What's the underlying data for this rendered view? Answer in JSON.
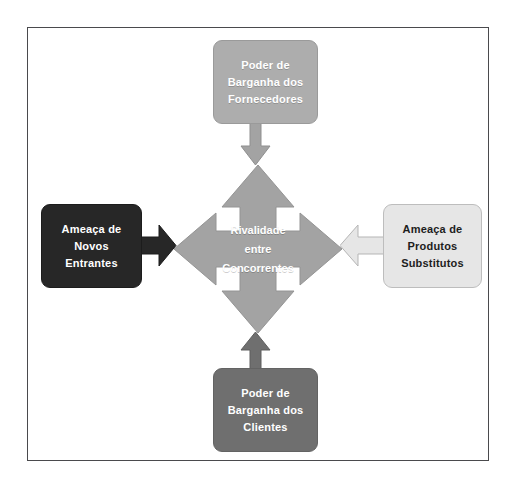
{
  "diagram": {
    "type": "porters-five-forces",
    "colors": {
      "frame_border": "#4a4a4d",
      "background": "#ffffff",
      "center_arrow": "#a3a3a3",
      "suppliers_box": "#adadad",
      "customers_box": "#6f6f6f",
      "entrants_box": "#272727",
      "substitutes_box": "#e6e6e6",
      "text_light": "#ffffff",
      "text_dark": "#1d1d1d"
    },
    "center": {
      "name": "rivalidade",
      "lines": [
        "Rivalidade",
        "entre",
        "Concorrentes"
      ],
      "line1": "Rivalidade",
      "line2": "entre",
      "line3": "Concorrentes"
    },
    "nodes": {
      "suppliers": {
        "position": "top",
        "line1": "Poder de",
        "line2": "Barganha dos",
        "line3": "Fornecedores",
        "arrow_direction": "down"
      },
      "customers": {
        "position": "bottom",
        "line1": "Poder de",
        "line2": "Barganha dos",
        "line3": "Clientes",
        "arrow_direction": "up"
      },
      "entrants": {
        "position": "left",
        "line1": "Ameaça de",
        "line2": "Novos",
        "line3": "Entrantes",
        "arrow_direction": "right"
      },
      "substitutes": {
        "position": "right",
        "line1": "Ameaça de",
        "line2": "Produtos",
        "line3": "Substitutos",
        "arrow_direction": "left"
      }
    }
  }
}
